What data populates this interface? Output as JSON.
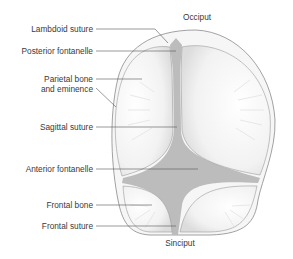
{
  "orientation": {
    "top": "Occiput",
    "bottom": "Sinciput"
  },
  "labels": [
    {
      "id": "lambdoid-suture",
      "text": "Lambdoid suture"
    },
    {
      "id": "posterior-fontanelle",
      "text": "Posterior fontanelle"
    },
    {
      "id": "parietal-bone",
      "text": "Parietal bone",
      "text2": "and eminence"
    },
    {
      "id": "sagittal-suture",
      "text": "Sagittal suture"
    },
    {
      "id": "anterior-fontanelle",
      "text": "Anterior fontanelle"
    },
    {
      "id": "frontal-bone",
      "text": "Frontal bone"
    },
    {
      "id": "frontal-suture",
      "text": "Frontal suture"
    }
  ],
  "colors": {
    "bone": "#f4f4f4",
    "bone_edge": "#8a8a8a",
    "membrane": "#b9b9b9",
    "leader": "#555555",
    "text": "#3a3a3a"
  }
}
